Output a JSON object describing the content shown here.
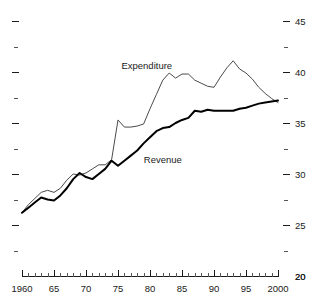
{
  "chart_data": {
    "type": "line",
    "title": "",
    "subtitle": "",
    "xlabel": "",
    "ylabel": "",
    "xlim": [
      1960,
      2000
    ],
    "ylim": [
      20,
      45
    ],
    "grid": false,
    "legend_position": "inline-annotations",
    "y_axis_side": "right",
    "y_ticks_major": [
      20,
      25,
      30,
      35,
      40,
      45
    ],
    "y_ticks_minor": [
      22.5,
      27.5,
      32.5,
      37.5,
      42.5
    ],
    "y_tick_labels": [
      "20",
      "25",
      "30",
      "35",
      "40",
      "45"
    ],
    "x_ticks_major": [
      1960,
      1965,
      1970,
      1975,
      1980,
      1985,
      1990,
      1995,
      2000
    ],
    "x_tick_labels": [
      "1960",
      "65",
      "70",
      "75",
      "80",
      "85",
      "90",
      "95",
      "2000"
    ],
    "x_ticks_minor_step": 1,
    "annotations": [
      {
        "text": "Expenditure",
        "x": 1979.5,
        "y": 40.6
      },
      {
        "text": "Revenue",
        "x": 1982.0,
        "y": 31.4
      }
    ],
    "x": [
      1960,
      1961,
      1962,
      1963,
      1964,
      1965,
      1966,
      1967,
      1968,
      1969,
      1970,
      1971,
      1972,
      1973,
      1974,
      1975,
      1976,
      1977,
      1978,
      1979,
      1980,
      1981,
      1982,
      1983,
      1984,
      1985,
      1986,
      1987,
      1988,
      1989,
      1990,
      1991,
      1992,
      1993,
      1994,
      1995,
      1996,
      1997,
      1998,
      1999,
      2000
    ],
    "series": [
      {
        "name": "Expenditure",
        "color": "#4a4a4a",
        "width": 1,
        "values": [
          26.2,
          27.0,
          27.6,
          28.2,
          28.4,
          28.2,
          28.6,
          29.4,
          30.0,
          29.9,
          30.1,
          30.5,
          30.9,
          30.9,
          31.4,
          35.3,
          34.6,
          34.6,
          34.7,
          34.9,
          36.4,
          37.8,
          39.2,
          39.9,
          39.4,
          39.8,
          39.8,
          39.2,
          38.9,
          38.6,
          38.5,
          39.5,
          40.4,
          41.1,
          40.3,
          39.9,
          39.3,
          38.5,
          37.9,
          37.4,
          37.0
        ]
      },
      {
        "name": "Revenue",
        "color": "#000000",
        "width": 2,
        "values": [
          26.2,
          26.7,
          27.2,
          27.7,
          27.5,
          27.4,
          27.9,
          28.6,
          29.5,
          30.1,
          29.7,
          29.5,
          30.0,
          30.5,
          31.3,
          30.8,
          31.3,
          31.8,
          32.3,
          33.0,
          33.6,
          34.2,
          34.5,
          34.6,
          35.0,
          35.3,
          35.5,
          36.2,
          36.1,
          36.3,
          36.2,
          36.2,
          36.2,
          36.2,
          36.4,
          36.5,
          36.7,
          36.9,
          37.0,
          37.1,
          37.2
        ]
      }
    ]
  },
  "axis": {
    "left_ticks_only": true,
    "bottom_axis_visible": true,
    "baseline_label": "20"
  }
}
